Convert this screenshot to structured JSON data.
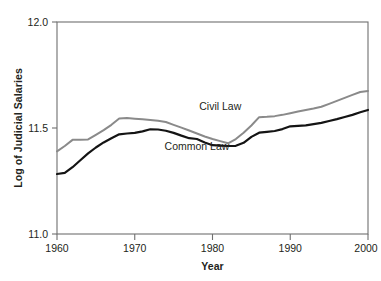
{
  "chart_data": {
    "type": "line",
    "title": "",
    "xlabel": "Year",
    "ylabel": "Log of Judicial Salaries",
    "xlim": [
      1960,
      2000
    ],
    "ylim": [
      11.0,
      12.0
    ],
    "xticks": [
      "1960",
      "1970",
      "1980",
      "1990",
      "2000"
    ],
    "xtick_values": [
      1960,
      1970,
      1980,
      1990,
      2000
    ],
    "yticks": [
      "11.0",
      "11.5",
      "12.0"
    ],
    "ytick_values": [
      11.0,
      11.5,
      12.0
    ],
    "grid": false,
    "legend": "inline-annotations",
    "x": [
      1960,
      1961,
      1962,
      1963,
      1964,
      1965,
      1966,
      1967,
      1968,
      1969,
      1970,
      1971,
      1972,
      1973,
      1974,
      1975,
      1976,
      1977,
      1978,
      1979,
      1980,
      1981,
      1982,
      1983,
      1984,
      1985,
      1986,
      1987,
      1988,
      1989,
      1990,
      1991,
      1992,
      1993,
      1994,
      1995,
      1996,
      1997,
      1998,
      1999,
      2000
    ],
    "series": [
      {
        "name": "Civil Law",
        "color": "#8a8a8a",
        "label_x": 1981,
        "label_y": 11.585,
        "values": [
          11.39,
          11.415,
          11.444,
          11.444,
          11.446,
          11.468,
          11.49,
          11.515,
          11.545,
          11.547,
          11.544,
          11.541,
          11.538,
          11.534,
          11.528,
          11.515,
          11.502,
          11.488,
          11.474,
          11.46,
          11.448,
          11.438,
          11.428,
          11.448,
          11.478,
          11.512,
          11.551,
          11.553,
          11.556,
          11.562,
          11.57,
          11.578,
          11.585,
          11.592,
          11.6,
          11.614,
          11.628,
          11.642,
          11.656,
          11.67,
          11.675
        ]
      },
      {
        "name": "Common Law",
        "color": "#141414",
        "label_x": 1978,
        "label_y": 11.395,
        "values": [
          11.283,
          11.288,
          11.315,
          11.348,
          11.38,
          11.408,
          11.432,
          11.452,
          11.47,
          11.474,
          11.477,
          11.484,
          11.494,
          11.493,
          11.487,
          11.477,
          11.464,
          11.452,
          11.448,
          11.432,
          11.419,
          11.417,
          11.415,
          11.416,
          11.43,
          11.458,
          11.478,
          11.482,
          11.486,
          11.495,
          11.508,
          11.51,
          11.512,
          11.518,
          11.524,
          11.533,
          11.542,
          11.552,
          11.562,
          11.574,
          11.585
        ]
      }
    ]
  }
}
